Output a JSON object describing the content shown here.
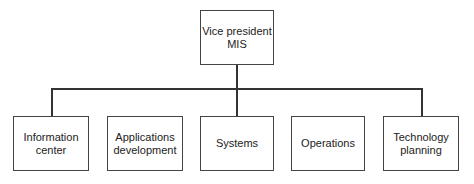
{
  "chart": {
    "root": {
      "line1": "Vice president",
      "line2": "MIS"
    },
    "children": [
      {
        "line1": "Information",
        "line2": "center"
      },
      {
        "line1": "Applications",
        "line2": "development"
      },
      {
        "line1": "Systems",
        "line2": ""
      },
      {
        "line1": "Operations",
        "line2": ""
      },
      {
        "line1": "Technology",
        "line2": "planning"
      }
    ]
  }
}
